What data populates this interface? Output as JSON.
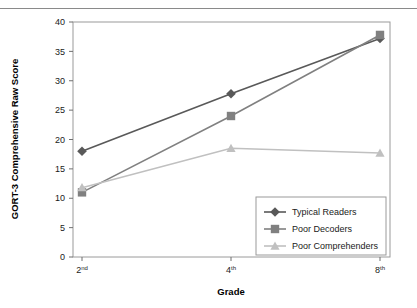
{
  "chart_data": {
    "type": "line",
    "title": "",
    "xlabel": "Grade",
    "ylabel": "GORT-3 Comprehensive Raw Score",
    "categories": [
      "2nd",
      "4th",
      "8th"
    ],
    "category_ordinals": [
      {
        "number": "2",
        "suffix": "nd"
      },
      {
        "number": "4",
        "suffix": "th"
      },
      {
        "number": "8",
        "suffix": "th"
      }
    ],
    "ylim": [
      0,
      40
    ],
    "ytick_step": 5,
    "yticks": [
      "0",
      "5",
      "10",
      "15",
      "20",
      "25",
      "30",
      "35",
      "40"
    ],
    "grid": false,
    "legend_position": "bottom-right-inside",
    "series": [
      {
        "name": "Typical Readers",
        "values": [
          18.0,
          27.8,
          37.2
        ],
        "color": "#595959",
        "marker": "diamond"
      },
      {
        "name": "Poor Decoders",
        "values": [
          11.0,
          24.0,
          37.8
        ],
        "color": "#808080",
        "marker": "square"
      },
      {
        "name": "Poor Comprehenders",
        "values": [
          11.8,
          18.5,
          17.7
        ],
        "color": "#c0c0c0",
        "marker": "triangle"
      }
    ]
  },
  "axes": {
    "y_axis_label": "GORT-3 Comprehensive Raw Score",
    "x_axis_label": "Grade"
  },
  "legend": {
    "items": [
      {
        "label": "Typical Readers"
      },
      {
        "label": "Poor Decoders"
      },
      {
        "label": "Poor Comprehenders"
      }
    ]
  },
  "colors": {
    "typical_readers": "#595959",
    "poor_decoders": "#808080",
    "poor_comprehenders": "#c0c0c0",
    "frame": "#9a9a9a",
    "rule": "#8a8a8a"
  }
}
